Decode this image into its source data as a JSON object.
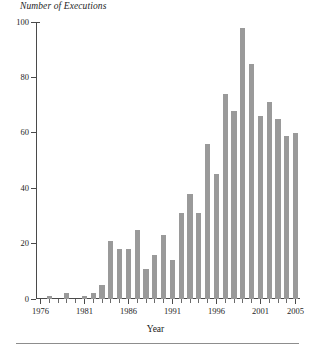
{
  "chart_data": {
    "type": "bar",
    "title": "Number of Executions",
    "xlabel": "Year",
    "ylabel": "Number of Executions",
    "ylim": [
      0,
      100
    ],
    "xlim": [
      1976,
      2005
    ],
    "grid": false,
    "legend": null,
    "bar_color": "#9a9a9a",
    "axis_color": "#4a4a4a",
    "y_ticks": [
      0,
      20,
      40,
      60,
      80,
      100
    ],
    "x_tick_labels": [
      "1976",
      "1981",
      "1986",
      "1991",
      "1996",
      "2001",
      "2005"
    ],
    "categories": [
      "1976",
      "1977",
      "1978",
      "1979",
      "1980",
      "1981",
      "1982",
      "1983",
      "1984",
      "1985",
      "1986",
      "1987",
      "1988",
      "1989",
      "1990",
      "1991",
      "1992",
      "1993",
      "1994",
      "1995",
      "1996",
      "1997",
      "1998",
      "1999",
      "2000",
      "2001",
      "2002",
      "2003",
      "2004",
      "2005"
    ],
    "values": [
      0,
      1,
      0,
      2,
      0,
      1,
      2,
      5,
      21,
      18,
      18,
      25,
      11,
      16,
      23,
      14,
      31,
      38,
      31,
      56,
      45,
      74,
      68,
      98,
      85,
      66,
      71,
      65,
      59,
      60
    ]
  },
  "footer": {
    "rule": ""
  }
}
